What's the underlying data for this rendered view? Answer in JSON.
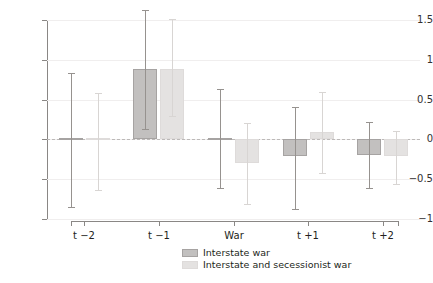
{
  "chart_data": {
    "type": "bar",
    "title": "",
    "subtitle": "",
    "xlabel": "",
    "ylabel": "",
    "categories": [
      "t −2",
      "t −1",
      "War",
      "t +1",
      "t +2"
    ],
    "ylim": [
      -1,
      1.5
    ],
    "yticks": [
      -1,
      -0.5,
      0,
      0.5,
      1,
      1.5
    ],
    "ytick_labels": [
      "−1",
      "−0.5",
      "0",
      "0.5",
      "1",
      "1.5"
    ],
    "grid": true,
    "zero_reference_line": 0,
    "orientation": "vertical",
    "legend_position": "bottom-center",
    "error_bars": "confidence interval",
    "series": [
      {
        "name": "Interstate war",
        "color": "#c2c0bf",
        "values": [
          0.0,
          0.88,
          0.0,
          -0.21,
          -0.2
        ],
        "ci_low": [
          -0.85,
          0.13,
          -0.61,
          -0.87,
          -0.61
        ],
        "ci_high": [
          0.83,
          1.62,
          0.63,
          0.41,
          0.22
        ]
      },
      {
        "name": "Interstate and secessionist war",
        "color": "#e4e2e1",
        "values": [
          0.0,
          0.88,
          -0.3,
          0.09,
          -0.21
        ],
        "ci_low": [
          -0.64,
          0.3,
          -0.81,
          -0.42,
          -0.56
        ],
        "ci_high": [
          0.58,
          1.51,
          0.2,
          0.6,
          0.11
        ]
      }
    ]
  },
  "legend": {
    "items": [
      {
        "label": "Interstate war",
        "swatch": "dark"
      },
      {
        "label": "Interstate and secessionist war",
        "swatch": "light"
      }
    ]
  }
}
